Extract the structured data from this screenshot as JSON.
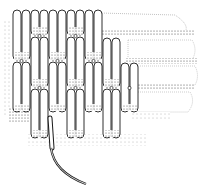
{
  "illustration": {
    "subject": "coiled basketry weave with stitching fiber",
    "colors": {
      "background": "#ffffff",
      "ink": "#1a1a1a",
      "stipple": "#555555"
    },
    "stitch_columns": [
      {
        "x": 13,
        "rows": [
          [
            10,
            60
          ],
          [
            62,
            112
          ]
        ]
      },
      {
        "x": 22,
        "rows": [
          [
            10,
            60
          ],
          [
            62,
            112
          ]
        ]
      },
      {
        "x": 31,
        "rows": [
          [
            10,
            35
          ],
          [
            37,
            87
          ],
          [
            89,
            138
          ]
        ]
      },
      {
        "x": 40,
        "rows": [
          [
            10,
            35
          ],
          [
            37,
            87
          ],
          [
            89,
            138
          ]
        ]
      },
      {
        "x": 49,
        "rows": [
          [
            10,
            60
          ],
          [
            62,
            112
          ]
        ]
      },
      {
        "x": 58,
        "rows": [
          [
            10,
            60
          ],
          [
            62,
            112
          ]
        ]
      },
      {
        "x": 67,
        "rows": [
          [
            10,
            35
          ],
          [
            37,
            87
          ],
          [
            89,
            138
          ]
        ]
      },
      {
        "x": 76,
        "rows": [
          [
            10,
            35
          ],
          [
            37,
            87
          ],
          [
            89,
            138
          ]
        ]
      },
      {
        "x": 85,
        "rows": [
          [
            10,
            60
          ],
          [
            62,
            112
          ]
        ]
      },
      {
        "x": 94,
        "rows": [
          [
            10,
            60
          ],
          [
            62,
            112
          ]
        ]
      },
      {
        "x": 103,
        "rows": [
          [
            38,
            87
          ],
          [
            89,
            138
          ]
        ]
      },
      {
        "x": 112,
        "rows": [
          [
            38,
            87
          ],
          [
            89,
            138
          ]
        ]
      },
      {
        "x": 121,
        "rows": [
          [
            63,
            112
          ]
        ]
      },
      {
        "x": 130,
        "rows": [
          [
            63,
            112
          ]
        ]
      }
    ]
  }
}
